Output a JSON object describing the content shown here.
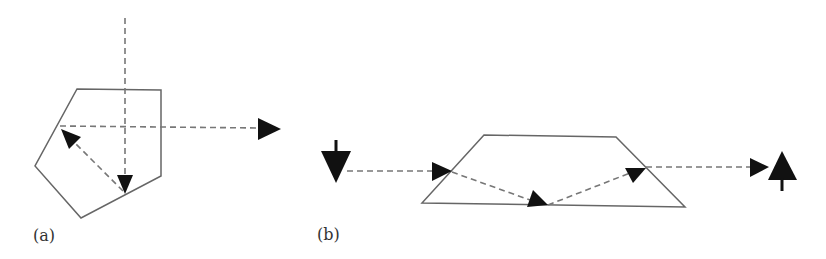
{
  "figure": {
    "panels": [
      {
        "id": "a",
        "label": "(a)",
        "shape": "pentagon",
        "description": "Ray enters pentagon vertically, reflects off lower-right face, reflects off upper-left face, exits horizontally to the right"
      },
      {
        "id": "b",
        "label": "(b)",
        "shape": "trapezoid",
        "description": "Ray enters trapezoid from left, refracts down to bottom face, reflects up and exits right; image orientation inverted (down arrow becomes up arrow)"
      }
    ],
    "input_arrow_b": "down",
    "output_arrow_b": "up",
    "colors": {
      "outline": "#666666",
      "dash": "#777777",
      "arrowhead": "#111111"
    }
  }
}
